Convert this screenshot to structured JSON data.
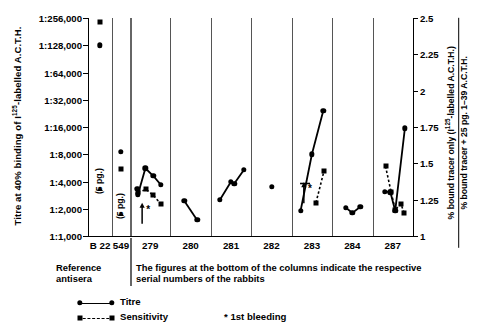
{
  "axis": {
    "y_left_title": "Titre at 40% binding of I125-labelled A.C.T.H.",
    "y_right_title_num": "% bound tracer only (I125-labelled A.C.T.H.)",
    "y_right_title_den": "% bound tracer + 25 pg. 1–39 A.C.T.H.",
    "y_left_ticks": [
      "1:256,000",
      "1:128,000",
      "1:64,000",
      "1:32,000",
      "1:16,000",
      "1:8,000",
      "1:4,000",
      "1:2,000",
      "1:1,000"
    ],
    "y_right_ticks": [
      "2.5",
      "2.25",
      "2",
      "1.75",
      "1.5",
      "1.25",
      "1"
    ],
    "x_ticks": [
      "B 22",
      "549",
      "279",
      "280",
      "281",
      "282",
      "283",
      "284",
      "287"
    ]
  },
  "captions": {
    "reference": "Reference antisera",
    "main": "The figures at the bottom of the columns indicate the respective serial numbers of the rabbits"
  },
  "legend": {
    "titre": "Titre",
    "sensitivity": "Sensitivity",
    "first_bleeding": "* 1st bleeding",
    "star_glyph": "*"
  },
  "annotations": {
    "pg_label": "(5 pg.)",
    "bleeding_marker": "*"
  },
  "chart_data": {
    "type": "line",
    "title": "",
    "xlabel": "",
    "ylabel": "Titre at 40% binding of I125-labelled A.C.T.H.",
    "y2label": "% bound tracer only (I125-labelled A.C.T.H.) / % bound tracer + 25 pg. 1-39 A.C.T.H.",
    "ylim": [
      1000,
      256000
    ],
    "y_scale": "log2",
    "y2lim": [
      1,
      2.5
    ],
    "grid": false,
    "legend_position": "bottom-left",
    "categories": [
      "B 22",
      "549",
      "279",
      "280",
      "281",
      "282",
      "283",
      "284",
      "287"
    ],
    "columns": [
      {
        "name": "B 22",
        "type": "reference",
        "titre_points": [
          {
            "x": 0.5,
            "titre": 128000
          }
        ],
        "sensitivity_points": [
          {
            "x": 0.5,
            "value": 2.47
          }
        ],
        "pg_marker": {
          "x": 0.5,
          "titre": 3300,
          "label": "(5 pg.)"
        }
      },
      {
        "name": "549",
        "type": "reference",
        "titre_points": [
          {
            "x": 0.5,
            "titre": 8500
          }
        ],
        "sensitivity_points": [
          {
            "x": 0.5,
            "value": 1.46
          }
        ],
        "pg_marker": {
          "x": 0.5,
          "titre": 1750,
          "label": "(5 pg.)"
        }
      },
      {
        "name": "279",
        "type": "rabbit",
        "titre_points": [
          {
            "x": 0.18,
            "titre": 3300
          },
          {
            "x": 0.2,
            "titre": 2900
          },
          {
            "x": 0.38,
            "titre": 5600
          },
          {
            "x": 0.58,
            "titre": 4600
          },
          {
            "x": 0.76,
            "titre": 3700
          }
        ],
        "sensitivity_points": [
          {
            "x": 0.2,
            "value": 1.3
          },
          {
            "x": 0.4,
            "value": 1.32
          },
          {
            "x": 0.58,
            "value": 1.28
          },
          {
            "x": 0.76,
            "value": 1.22
          }
        ],
        "first_bleeding": {
          "x": 0.3,
          "titre": 1900
        }
      },
      {
        "name": "280",
        "type": "rabbit",
        "titre_points": [
          {
            "x": 0.34,
            "titre": 2450
          },
          {
            "x": 0.66,
            "titre": 1500
          }
        ],
        "sensitivity_points": []
      },
      {
        "name": "281",
        "type": "rabbit",
        "titre_points": [
          {
            "x": 0.22,
            "titre": 2500
          },
          {
            "x": 0.5,
            "titre": 4000
          },
          {
            "x": 0.58,
            "titre": 3800
          },
          {
            "x": 0.82,
            "titre": 5400
          }
        ],
        "sensitivity_points": []
      },
      {
        "name": "282",
        "type": "rabbit",
        "titre_points": [
          {
            "x": 0.5,
            "titre": 3500
          }
        ],
        "sensitivity_points": []
      },
      {
        "name": "283",
        "type": "rabbit",
        "titre_points": [
          {
            "x": 0.22,
            "titre": 1900
          },
          {
            "x": 0.5,
            "titre": 8000
          },
          {
            "x": 0.78,
            "titre": 24000
          }
        ],
        "sensitivity_points": [
          {
            "x": 0.6,
            "value": 1.23
          },
          {
            "x": 0.8,
            "value": 1.45
          }
        ],
        "first_bleeding": {
          "x": 0.3,
          "titre": 3200
        }
      },
      {
        "name": "284",
        "type": "rabbit",
        "titre_points": [
          {
            "x": 0.34,
            "titre": 2050
          },
          {
            "x": 0.5,
            "titre": 1800
          },
          {
            "x": 0.7,
            "titre": 2100
          }
        ],
        "sensitivity_points": []
      },
      {
        "name": "287",
        "type": "rabbit",
        "titre_points": [
          {
            "x": 0.3,
            "titre": 3100
          },
          {
            "x": 0.44,
            "titre": 3050
          },
          {
            "x": 0.56,
            "titre": 1900
          },
          {
            "x": 0.8,
            "titre": 15500
          }
        ],
        "sensitivity_points": [
          {
            "x": 0.32,
            "value": 1.48
          },
          {
            "x": 0.46,
            "value": 1.3
          },
          {
            "x": 0.56,
            "value": 1.18
          },
          {
            "x": 0.7,
            "value": 1.22
          },
          {
            "x": 0.78,
            "value": 1.16
          }
        ]
      }
    ],
    "series": [
      {
        "name": "Titre",
        "marker": "circle",
        "line": "solid"
      },
      {
        "name": "Sensitivity",
        "marker": "square",
        "line": "dashed"
      }
    ]
  }
}
